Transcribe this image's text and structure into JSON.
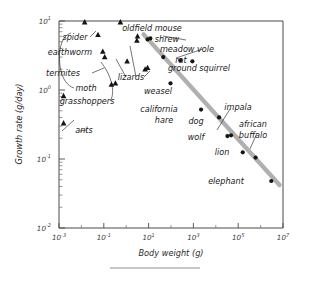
{
  "chart_data": {
    "type": "scatter",
    "title": "",
    "xlabel": "Body weight (g)",
    "ylabel": "Growth rate (g/day)",
    "xscale": "log",
    "yscale": "log",
    "xlim": [
      0.001,
      10000000
    ],
    "ylim": [
      0.01,
      10
    ],
    "grid": false,
    "legend": false,
    "xticks": [
      "10-3",
      "10-1",
      "101",
      "103",
      "105",
      "107"
    ],
    "xtick_labels": [
      {
        "base": "10",
        "exp": "-3"
      },
      {
        "base": "10",
        "exp": "-1"
      },
      {
        "base": "10",
        "exp": "1"
      },
      {
        "base": "10",
        "exp": "3"
      },
      {
        "base": "10",
        "exp": "5"
      },
      {
        "base": "10",
        "exp": "7"
      }
    ],
    "ytick_labels": [
      {
        "base": "10",
        "exp": "1"
      },
      {
        "base": "10",
        "exp": "0"
      },
      {
        "base": "10",
        "exp": "-1"
      },
      {
        "base": "10",
        "exp": "-2"
      }
    ],
    "series": [
      {
        "name": "invertebrates and lizards",
        "marker": "triangle",
        "color": "#141414",
        "points": [
          {
            "label": "spider",
            "x": 0.014,
            "y": 9.6
          },
          {
            "label": "spider",
            "x": 0.055,
            "y": 6.3
          },
          {
            "label": "earthworm",
            "x": 0.09,
            "y": 3.6
          },
          {
            "label": "termites",
            "x": 0.11,
            "y": 3.0
          },
          {
            "label": "moth",
            "x": 0.22,
            "y": 1.2
          },
          {
            "label": "moth",
            "x": 0.33,
            "y": 1.25
          },
          {
            "label": "grasshoppers",
            "x": 0.55,
            "y": 9.6
          },
          {
            "label": "grasshoppers",
            "x": 1.1,
            "y": 2.6
          },
          {
            "label": "lizards",
            "x": 3.0,
            "y": 5.2
          },
          {
            "label": "lizards",
            "x": 3.2,
            "y": 6.0
          },
          {
            "label": "lizards",
            "x": 7.0,
            "y": 2.0
          },
          {
            "label": "lizards",
            "x": 9.0,
            "y": 2.1
          },
          {
            "label": "ants",
            "x": 0.0016,
            "y": 0.82
          },
          {
            "label": "ants",
            "x": 0.0016,
            "y": 0.33
          }
        ]
      },
      {
        "name": "mammals",
        "marker": "circle",
        "color": "#141414",
        "points": [
          {
            "label": "oldfield mouse",
            "x": 9.0,
            "y": 5.4
          },
          {
            "label": "shrew",
            "x": 12.0,
            "y": 5.6
          },
          {
            "label": "meadow vole",
            "x": 45.0,
            "y": 3.0
          },
          {
            "label": "rat",
            "x": 260.0,
            "y": 2.7
          },
          {
            "label": "ground squirrel",
            "x": 900.0,
            "y": 2.6
          },
          {
            "label": "weasel",
            "x": 95.0,
            "y": 1.25
          },
          {
            "label": "california hare",
            "x": 2200.0,
            "y": 0.52
          },
          {
            "label": "dog",
            "x": 14000.0,
            "y": 0.4
          },
          {
            "label": "wolf",
            "x": 33000.0,
            "y": 0.215
          },
          {
            "label": "impala",
            "x": 48000.0,
            "y": 0.22
          },
          {
            "label": "lion",
            "x": 160000.0,
            "y": 0.125
          },
          {
            "label": "african buffalo",
            "x": 600000.0,
            "y": 0.105
          },
          {
            "label": "elephant",
            "x": 3000000.0,
            "y": 0.048
          }
        ]
      }
    ],
    "trendline": {
      "label": "",
      "color": "#b0b0b0",
      "x_start": 6.0,
      "y_start": 6.4,
      "x_end": 7000000.0,
      "y_end": 0.042
    },
    "annotations": [
      {
        "text": "spider",
        "x": 75,
        "y": 40
      },
      {
        "text": "earthworm",
        "x": 70,
        "y": 55
      },
      {
        "text": "termites",
        "x": 63,
        "y": 76
      },
      {
        "text": "moth",
        "x": 86,
        "y": 91
      },
      {
        "text": "grasshoppers",
        "x": 87,
        "y": 104
      },
      {
        "text": "ants",
        "x": 84,
        "y": 133
      },
      {
        "text": "lizards",
        "x": 131,
        "y": 80
      },
      {
        "text": "oldfield mouse",
        "x": 152,
        "y": 31
      },
      {
        "text": "shrew",
        "x": 167,
        "y": 42
      },
      {
        "text": "meadow vole",
        "x": 187,
        "y": 52
      },
      {
        "text": "rat",
        "x": 181,
        "y": 63
      },
      {
        "text": "ground squirrel",
        "x": 199,
        "y": 71
      },
      {
        "text": "weasel",
        "x": 158,
        "y": 94
      },
      {
        "text": "california",
        "x": 159,
        "y": 112
      },
      {
        "text": "hare",
        "x": 164,
        "y": 123
      },
      {
        "text": "dog",
        "x": 196,
        "y": 124
      },
      {
        "text": "wolf",
        "x": 196,
        "y": 140
      },
      {
        "text": "impala",
        "x": 238,
        "y": 110
      },
      {
        "text": "african",
        "x": 253,
        "y": 127
      },
      {
        "text": "buffalo",
        "x": 253,
        "y": 138
      },
      {
        "text": "lion",
        "x": 222,
        "y": 155
      },
      {
        "text": "elephant",
        "x": 226,
        "y": 184
      }
    ]
  },
  "figure": {
    "xlabel": "Body weight (g)",
    "ylabel": "Growth rate (g/day)",
    "footer_rule": "divider"
  },
  "labels": {
    "spider": "spider",
    "earthworm": "earthworm",
    "termites": "termites",
    "moth": "moth",
    "grasshoppers": "grasshoppers",
    "ants": "ants",
    "lizards": "lizards",
    "oldfield_mouse": "oldfield mouse",
    "shrew": "shrew",
    "meadow_vole": "meadow vole",
    "rat": "rat",
    "ground_squirrel": "ground squirrel",
    "weasel": "weasel",
    "california": "california",
    "hare": "hare",
    "dog": "dog",
    "wolf": "wolf",
    "impala": "impala",
    "african": "african",
    "buffalo": "buffalo",
    "lion": "lion",
    "elephant": "elephant"
  },
  "colors": {
    "axis": "#4a4a4a",
    "marker": "#141414",
    "trendline": "#b0b0b0",
    "text": "#1a1a1a",
    "background": "#ffffff"
  }
}
